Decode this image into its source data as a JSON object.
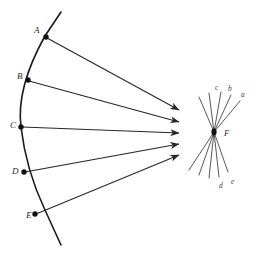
{
  "figure": {
    "background_color": "#ffffff",
    "stroke_color": "#1a1a1a",
    "ray_color": "#262626",
    "fan_color": "#3a3a3a",
    "label_color": "#2b2b2b"
  },
  "mirror": {
    "name": "concave-mirror-arc",
    "path": "M 61 12 L 45 36 Q 16 88 21 127 Q 26 170 45 210 L 61 245",
    "points": [
      {
        "id": "A",
        "label": "A",
        "x": 46,
        "y": 37,
        "label_x": 34,
        "label_y": 31
      },
      {
        "id": "B",
        "label": "B",
        "x": 28,
        "y": 80,
        "label_x": 17,
        "label_y": 77
      },
      {
        "id": "C",
        "label": "C",
        "x": 21,
        "y": 127,
        "label_x": 10,
        "label_y": 126
      },
      {
        "id": "D",
        "label": "D",
        "x": 24,
        "y": 172,
        "label_x": 12,
        "label_y": 172
      },
      {
        "id": "E",
        "label": "E",
        "x": 35,
        "y": 214,
        "label_x": 26,
        "label_y": 216
      }
    ]
  },
  "rays": [
    {
      "id": "ray-A",
      "from": "A",
      "x1": 47,
      "y1": 38,
      "x2": 179,
      "y2": 110
    },
    {
      "id": "ray-B",
      "from": "B",
      "x1": 29,
      "y1": 81,
      "x2": 179,
      "y2": 122
    },
    {
      "id": "ray-C",
      "from": "C",
      "x1": 22,
      "y1": 127,
      "x2": 179,
      "y2": 133
    },
    {
      "id": "ray-D",
      "from": "D",
      "x1": 25,
      "y1": 172,
      "x2": 179,
      "y2": 144
    },
    {
      "id": "ray-E",
      "from": "E",
      "x1": 36,
      "y1": 214,
      "x2": 179,
      "y2": 155
    }
  ],
  "focus_detail": {
    "name": "focus-crossing-detail",
    "focus_label": "F",
    "focus_x": 214,
    "focus_y": 132,
    "focus_label_x": 224,
    "focus_label_y": 134,
    "upper_lines": [
      {
        "id": "u-a",
        "label": "a",
        "x": 240,
        "y": 101,
        "label_x": 241,
        "label_y": 95
      },
      {
        "id": "u-b",
        "label": "b",
        "x": 231,
        "y": 95,
        "label_x": 228,
        "label_y": 89
      },
      {
        "id": "u-c",
        "label": "c",
        "x": 221,
        "y": 92,
        "label_x": 215,
        "label_y": 88
      },
      {
        "id": "u-d",
        "label": "",
        "x": 209,
        "y": 93,
        "label_x": 0,
        "label_y": 0
      },
      {
        "id": "u-e",
        "label": "",
        "x": 199,
        "y": 97,
        "label_x": 0,
        "label_y": 0
      }
    ],
    "lower_lines": [
      {
        "id": "l-a",
        "label": "",
        "x": 189,
        "y": 170,
        "label_x": 0,
        "label_y": 0
      },
      {
        "id": "l-b",
        "label": "",
        "x": 199,
        "y": 175,
        "label_x": 0,
        "label_y": 0
      },
      {
        "id": "l-c",
        "label": "",
        "x": 209,
        "y": 178,
        "label_x": 0,
        "label_y": 0
      },
      {
        "id": "l-d",
        "label": "d",
        "x": 219,
        "y": 177,
        "label_x": 219,
        "label_y": 186
      },
      {
        "id": "l-e",
        "label": "e",
        "x": 228,
        "y": 172,
        "label_x": 231,
        "label_y": 182
      }
    ]
  }
}
